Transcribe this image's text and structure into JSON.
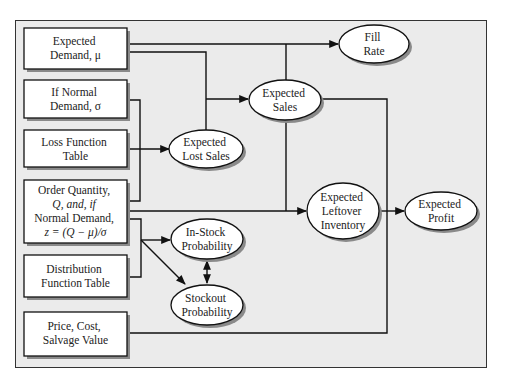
{
  "diagram": {
    "colors": {
      "frame_fill": "#ebebeb",
      "frame_border": "#333333",
      "node_fill": "#ffffff",
      "stroke": "#111111",
      "shadow": "#8a8a8a"
    },
    "inputs": [
      {
        "id": "expected-demand",
        "lines": [
          "Expected",
          "Demand, μ"
        ]
      },
      {
        "id": "normal-sigma",
        "lines": [
          "If Normal",
          "Demand, σ"
        ]
      },
      {
        "id": "loss-function-table",
        "lines": [
          "Loss Function",
          "Table"
        ]
      },
      {
        "id": "order-quantity",
        "lines": [
          "Order Quantity,",
          "Q, and, if",
          "Normal Demand,",
          "z = (Q − μ)/σ"
        ]
      },
      {
        "id": "distribution-function-table",
        "lines": [
          "Distribution",
          "Function Table"
        ]
      },
      {
        "id": "price-cost-salvage",
        "lines": [
          "Price, Cost,",
          "Salvage Value"
        ]
      }
    ],
    "outputs": [
      {
        "id": "fill-rate",
        "lines": [
          "Fill",
          "Rate"
        ]
      },
      {
        "id": "expected-sales",
        "lines": [
          "Expected",
          "Sales"
        ]
      },
      {
        "id": "expected-lost-sales",
        "lines": [
          "Expected",
          "Lost Sales"
        ]
      },
      {
        "id": "expected-leftover-inventory",
        "lines": [
          "Expected",
          "Leftover",
          "Inventory"
        ]
      },
      {
        "id": "expected-profit",
        "lines": [
          "Expected",
          "Profit"
        ]
      },
      {
        "id": "in-stock-probability",
        "lines": [
          "In-Stock",
          "Probability"
        ]
      },
      {
        "id": "stockout-probability",
        "lines": [
          "Stockout",
          "Probability"
        ]
      }
    ]
  }
}
